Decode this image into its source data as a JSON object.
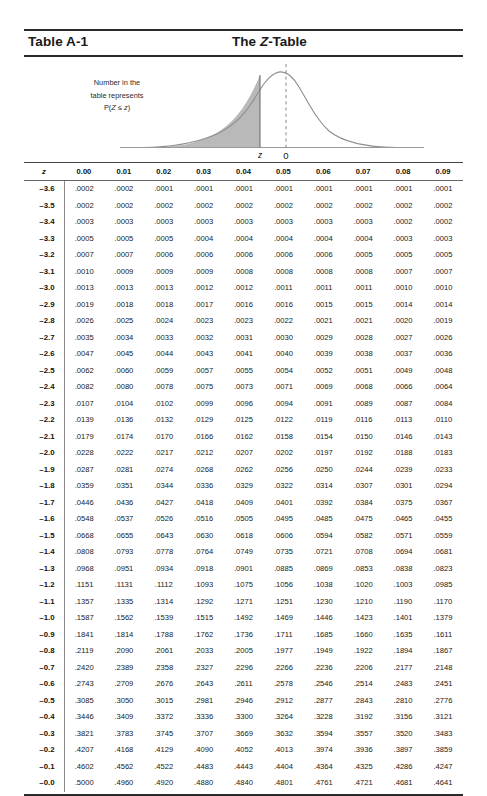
{
  "header": {
    "left_title": "Table A-1",
    "center_title_prefix": "The ",
    "center_title_italic": "Z",
    "center_title_suffix": "-Table"
  },
  "figure": {
    "caption_line1": "Number in the",
    "caption_line2": "table represents",
    "caption_line3_prefix": "P(",
    "caption_line3_italic1": "Z",
    "caption_line3_mid": " ≤ ",
    "caption_line3_italic2": "z",
    "caption_line3_suffix": ")",
    "axis_label_z": "z",
    "axis_label_zero": "0",
    "shade_color": "#b8b8b8",
    "curve_color": "#8e8e8e"
  },
  "table": {
    "columns": [
      "z",
      "0.00",
      "0.01",
      "0.02",
      "0.03",
      "0.04",
      "0.05",
      "0.06",
      "0.07",
      "0.08",
      "0.09"
    ],
    "rows": [
      {
        "z": "–3.6",
        "values": [
          ".0002",
          ".0002",
          ".0001",
          ".0001",
          ".0001",
          ".0001",
          ".0001",
          ".0001",
          ".0001",
          ".0001"
        ]
      },
      {
        "z": "–3.5",
        "values": [
          ".0002",
          ".0002",
          ".0002",
          ".0002",
          ".0002",
          ".0002",
          ".0002",
          ".0002",
          ".0002",
          ".0002"
        ]
      },
      {
        "z": "–3.4",
        "values": [
          ".0003",
          ".0003",
          ".0003",
          ".0003",
          ".0003",
          ".0003",
          ".0003",
          ".0003",
          ".0002",
          ".0002"
        ]
      },
      {
        "z": "–3.3",
        "values": [
          ".0005",
          ".0005",
          ".0005",
          ".0004",
          ".0004",
          ".0004",
          ".0004",
          ".0004",
          ".0003",
          ".0003"
        ]
      },
      {
        "z": "–3.2",
        "values": [
          ".0007",
          ".0007",
          ".0006",
          ".0006",
          ".0006",
          ".0006",
          ".0006",
          ".0005",
          ".0005",
          ".0005"
        ]
      },
      {
        "z": "–3.1",
        "values": [
          ".0010",
          ".0009",
          ".0009",
          ".0009",
          ".0008",
          ".0008",
          ".0008",
          ".0008",
          ".0007",
          ".0007"
        ]
      },
      {
        "z": "–3.0",
        "values": [
          ".0013",
          ".0013",
          ".0013",
          ".0012",
          ".0012",
          ".0011",
          ".0011",
          ".0011",
          ".0010",
          ".0010"
        ]
      },
      {
        "z": "–2.9",
        "values": [
          ".0019",
          ".0018",
          ".0018",
          ".0017",
          ".0016",
          ".0016",
          ".0015",
          ".0015",
          ".0014",
          ".0014"
        ]
      },
      {
        "z": "–2.8",
        "values": [
          ".0026",
          ".0025",
          ".0024",
          ".0023",
          ".0023",
          ".0022",
          ".0021",
          ".0021",
          ".0020",
          ".0019"
        ]
      },
      {
        "z": "–2.7",
        "values": [
          ".0035",
          ".0034",
          ".0033",
          ".0032",
          ".0031",
          ".0030",
          ".0029",
          ".0028",
          ".0027",
          ".0026"
        ]
      },
      {
        "z": "–2.6",
        "values": [
          ".0047",
          ".0045",
          ".0044",
          ".0043",
          ".0041",
          ".0040",
          ".0039",
          ".0038",
          ".0037",
          ".0036"
        ]
      },
      {
        "z": "–2.5",
        "values": [
          ".0062",
          ".0060",
          ".0059",
          ".0057",
          ".0055",
          ".0054",
          ".0052",
          ".0051",
          ".0049",
          ".0048"
        ]
      },
      {
        "z": "–2.4",
        "values": [
          ".0082",
          ".0080",
          ".0078",
          ".0075",
          ".0073",
          ".0071",
          ".0069",
          ".0068",
          ".0066",
          ".0064"
        ]
      },
      {
        "z": "–2.3",
        "values": [
          ".0107",
          ".0104",
          ".0102",
          ".0099",
          ".0096",
          ".0094",
          ".0091",
          ".0089",
          ".0087",
          ".0084"
        ]
      },
      {
        "z": "–2.2",
        "values": [
          ".0139",
          ".0136",
          ".0132",
          ".0129",
          ".0125",
          ".0122",
          ".0119",
          ".0116",
          ".0113",
          ".0110"
        ]
      },
      {
        "z": "–2.1",
        "values": [
          ".0179",
          ".0174",
          ".0170",
          ".0166",
          ".0162",
          ".0158",
          ".0154",
          ".0150",
          ".0146",
          ".0143"
        ]
      },
      {
        "z": "–2.0",
        "values": [
          ".0228",
          ".0222",
          ".0217",
          ".0212",
          ".0207",
          ".0202",
          ".0197",
          ".0192",
          ".0188",
          ".0183"
        ]
      },
      {
        "z": "–1.9",
        "values": [
          ".0287",
          ".0281",
          ".0274",
          ".0268",
          ".0262",
          ".0256",
          ".0250",
          ".0244",
          ".0239",
          ".0233"
        ]
      },
      {
        "z": "–1.8",
        "values": [
          ".0359",
          ".0351",
          ".0344",
          ".0336",
          ".0329",
          ".0322",
          ".0314",
          ".0307",
          ".0301",
          ".0294"
        ]
      },
      {
        "z": "–1.7",
        "values": [
          ".0446",
          ".0436",
          ".0427",
          ".0418",
          ".0409",
          ".0401",
          ".0392",
          ".0384",
          ".0375",
          ".0367"
        ]
      },
      {
        "z": "–1.6",
        "values": [
          ".0548",
          ".0537",
          ".0526",
          ".0516",
          ".0505",
          ".0495",
          ".0485",
          ".0475",
          ".0465",
          ".0455"
        ]
      },
      {
        "z": "–1.5",
        "values": [
          ".0668",
          ".0655",
          ".0643",
          ".0630",
          ".0618",
          ".0606",
          ".0594",
          ".0582",
          ".0571",
          ".0559"
        ]
      },
      {
        "z": "–1.4",
        "values": [
          ".0808",
          ".0793",
          ".0778",
          ".0764",
          ".0749",
          ".0735",
          ".0721",
          ".0708",
          ".0694",
          ".0681"
        ]
      },
      {
        "z": "–1.3",
        "values": [
          ".0968",
          ".0951",
          ".0934",
          ".0918",
          ".0901",
          ".0885",
          ".0869",
          ".0853",
          ".0838",
          ".0823"
        ]
      },
      {
        "z": "–1.2",
        "values": [
          ".1151",
          ".1131",
          ".1112",
          ".1093",
          ".1075",
          ".1056",
          ".1038",
          ".1020",
          ".1003",
          ".0985"
        ]
      },
      {
        "z": "–1.1",
        "values": [
          ".1357",
          ".1335",
          ".1314",
          ".1292",
          ".1271",
          ".1251",
          ".1230",
          ".1210",
          ".1190",
          ".1170"
        ]
      },
      {
        "z": "–1.0",
        "values": [
          ".1587",
          ".1562",
          ".1539",
          ".1515",
          ".1492",
          ".1469",
          ".1446",
          ".1423",
          ".1401",
          ".1379"
        ]
      },
      {
        "z": "–0.9",
        "values": [
          ".1841",
          ".1814",
          ".1788",
          ".1762",
          ".1736",
          ".1711",
          ".1685",
          ".1660",
          ".1635",
          ".1611"
        ]
      },
      {
        "z": "–0.8",
        "values": [
          ".2119",
          ".2090",
          ".2061",
          ".2033",
          ".2005",
          ".1977",
          ".1949",
          ".1922",
          ".1894",
          ".1867"
        ]
      },
      {
        "z": "–0.7",
        "values": [
          ".2420",
          ".2389",
          ".2358",
          ".2327",
          ".2296",
          ".2266",
          ".2236",
          ".2206",
          ".2177",
          ".2148"
        ]
      },
      {
        "z": "–0.6",
        "values": [
          ".2743",
          ".2709",
          ".2676",
          ".2643",
          ".2611",
          ".2578",
          ".2546",
          ".2514",
          ".2483",
          ".2451"
        ]
      },
      {
        "z": "–0.5",
        "values": [
          ".3085",
          ".3050",
          ".3015",
          ".2981",
          ".2946",
          ".2912",
          ".2877",
          ".2843",
          ".2810",
          ".2776"
        ]
      },
      {
        "z": "–0.4",
        "values": [
          ".3446",
          ".3409",
          ".3372",
          ".3336",
          ".3300",
          ".3264",
          ".3228",
          ".3192",
          ".3156",
          ".3121"
        ]
      },
      {
        "z": "–0.3",
        "values": [
          ".3821",
          ".3783",
          ".3745",
          ".3707",
          ".3669",
          ".3632",
          ".3594",
          ".3557",
          ".3520",
          ".3483"
        ]
      },
      {
        "z": "–0.2",
        "values": [
          ".4207",
          ".4168",
          ".4129",
          ".4090",
          ".4052",
          ".4013",
          ".3974",
          ".3936",
          ".3897",
          ".3859"
        ]
      },
      {
        "z": "–0.1",
        "values": [
          ".4602",
          ".4562",
          ".4522",
          ".4483",
          ".4443",
          ".4404",
          ".4364",
          ".4325",
          ".4286",
          ".4247"
        ]
      },
      {
        "z": "–0.0",
        "values": [
          ".5000",
          ".4960",
          ".4920",
          ".4880",
          ".4840",
          ".4801",
          ".4761",
          ".4721",
          ".4681",
          ".4641"
        ]
      }
    ]
  }
}
